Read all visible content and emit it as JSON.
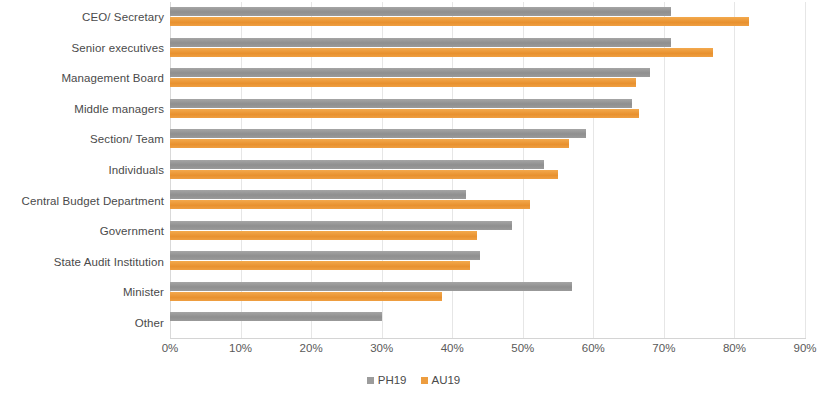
{
  "chart_data": {
    "type": "bar",
    "orientation": "horizontal",
    "title": "",
    "subtitle": "",
    "xlabel": "",
    "ylabel": "",
    "xlim": [
      0,
      90
    ],
    "xtick_labels": [
      "0%",
      "10%",
      "20%",
      "30%",
      "40%",
      "50%",
      "60%",
      "70%",
      "80%",
      "90%"
    ],
    "xtick_values": [
      0,
      10,
      20,
      30,
      40,
      50,
      60,
      70,
      80,
      90
    ],
    "grid": true,
    "grid_axis": "x",
    "legend_position": "bottom",
    "categories": [
      "CEO/ Secretary",
      "Senior executives",
      "Management Board",
      "Middle managers",
      "Section/ Team",
      "Individuals",
      "Central Budget Department",
      "Government",
      "State Audit Institution",
      "Minister",
      "Other"
    ],
    "series": [
      {
        "name": "PH19",
        "color": "#9c9c9c",
        "values": [
          71,
          71,
          68,
          65.5,
          59,
          53,
          42,
          48.5,
          44,
          57,
          30
        ]
      },
      {
        "name": "AU19",
        "color": "#ed9d3f",
        "values": [
          82,
          77,
          66,
          66.5,
          56.5,
          55,
          51,
          43.5,
          42.5,
          38.5,
          0
        ]
      }
    ]
  },
  "legend": {
    "items": [
      {
        "label": "PH19",
        "swatch": "ph19"
      },
      {
        "label": "AU19",
        "swatch": "au19"
      }
    ]
  }
}
